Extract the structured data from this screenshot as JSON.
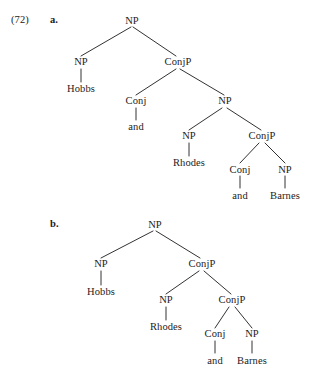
{
  "figure": {
    "example_number": "(72)",
    "items": [
      {
        "letter": "a."
      },
      {
        "letter": "b."
      }
    ]
  },
  "tree_a": {
    "nodes": {
      "root": "NP",
      "np_hobbs": "NP",
      "hobbs": "Hobbs",
      "conjp_1": "ConjP",
      "conj_1": "Conj",
      "and_1": "and",
      "np_2": "NP",
      "np_rhodes": "NP",
      "rhodes": "Rhodes",
      "conjp_2": "ConjP",
      "conj_2": "Conj",
      "and_2": "and",
      "np_barnes": "NP",
      "barnes": "Barnes"
    }
  },
  "tree_b": {
    "nodes": {
      "root": "NP",
      "np_hobbs": "NP",
      "hobbs": "Hobbs",
      "conjp_1": "ConjP",
      "np_rhodes": "NP",
      "rhodes": "Rhodes",
      "conjp_2": "ConjP",
      "conj_1": "Conj",
      "and_1": "and",
      "np_barnes": "NP",
      "barnes": "Barnes"
    }
  }
}
